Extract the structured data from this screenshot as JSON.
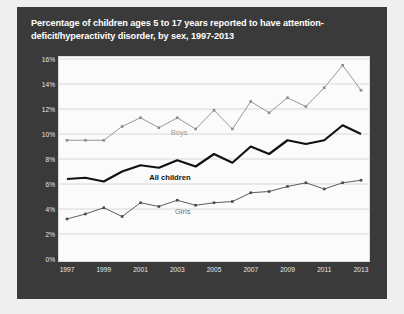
{
  "chart_data": {
    "type": "line",
    "title": "Percentage of children ages 5 to 17 years reported to have attention-deficit/hyperactivity disorder, by sex, 1997-2013",
    "xlabel": "",
    "ylabel": "",
    "grid": true,
    "legend_position": "inline-labels",
    "ylim": [
      0,
      16
    ],
    "ytick_labels": [
      "0%",
      "2%",
      "4%",
      "6%",
      "8%",
      "10%",
      "12%",
      "14%",
      "16%"
    ],
    "ytick_values": [
      0,
      2,
      4,
      6,
      8,
      10,
      12,
      14,
      16
    ],
    "xlim": [
      1997,
      2013
    ],
    "xtick_labels": [
      "1997",
      "1999",
      "2001",
      "2003",
      "2005",
      "2007",
      "2009",
      "2011",
      "2013"
    ],
    "xtick_values": [
      1997,
      1999,
      2001,
      2003,
      2005,
      2007,
      2009,
      2011,
      2013
    ],
    "x": [
      1997,
      1998,
      1999,
      2000,
      2001,
      2002,
      2003,
      2004,
      2005,
      2006,
      2007,
      2008,
      2009,
      2010,
      2011,
      2012,
      2013
    ],
    "series": [
      {
        "name": "Boys",
        "color": "#8c8c8c",
        "values": [
          9.5,
          9.5,
          9.5,
          10.6,
          11.3,
          10.5,
          11.3,
          10.4,
          11.9,
          10.4,
          12.6,
          11.7,
          12.9,
          12.2,
          13.7,
          15.5,
          13.5
        ]
      },
      {
        "name": "All children",
        "color": "#111111",
        "values": [
          6.4,
          6.5,
          6.2,
          7.0,
          7.5,
          7.3,
          7.9,
          7.4,
          8.4,
          7.7,
          9.0,
          8.4,
          9.5,
          9.2,
          9.5,
          10.7,
          10.0
        ]
      },
      {
        "name": "Girls",
        "color": "#4a4a4a",
        "values": [
          3.2,
          3.6,
          4.1,
          3.4,
          4.5,
          4.2,
          4.7,
          4.3,
          4.5,
          4.6,
          5.3,
          5.4,
          5.8,
          6.1,
          5.6,
          6.1,
          6.3
        ]
      }
    ],
    "annotations": [
      {
        "text": "Boys",
        "x": 2003.1,
        "y": 10.2
      },
      {
        "text": "All children",
        "x": 2002.6,
        "y": 6.55
      },
      {
        "text": "Girls",
        "x": 2003.3,
        "y": 3.85
      }
    ]
  }
}
